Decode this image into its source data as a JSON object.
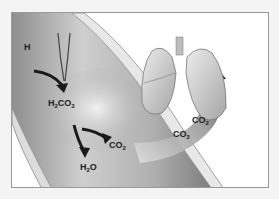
{
  "diagram": {
    "labels": {
      "h": "H",
      "h2co3_main": "H",
      "h2co3_sub": "2",
      "h2co3_tail": "CO",
      "h2co3_sub2": "3",
      "co2_blood_main": "CO",
      "co2_blood_sub": "2",
      "h2o_main": "H",
      "h2o_sub": "2",
      "h2o_tail": "O",
      "co2_arc1_main": "CO",
      "co2_arc1_sub": "2",
      "co2_arc2_main": "CO",
      "co2_arc2_sub": "2"
    },
    "colors": {
      "background": "#ffffff",
      "vessel": "#b9b9b9",
      "arrow": "#1a1a1a",
      "lung": "#d4d4d4",
      "border": "#9a9a9a"
    }
  }
}
